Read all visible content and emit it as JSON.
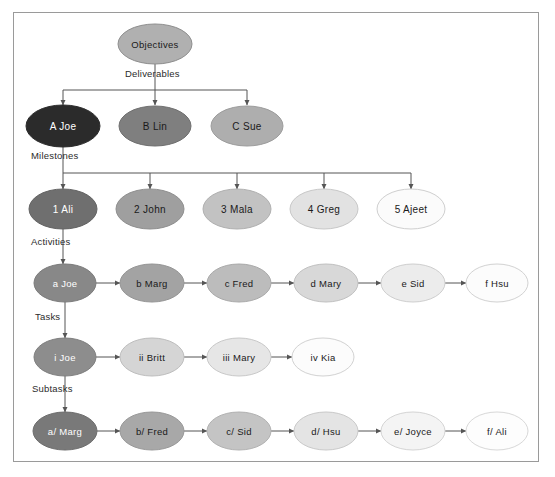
{
  "diagram": {
    "frame": {
      "x": 13,
      "y": 12,
      "width": 526,
      "height": 450,
      "border_color": "#9a9a9a"
    },
    "connector_color": "#555555",
    "levels": [
      {
        "id": "objectives",
        "name": "Objectives"
      },
      {
        "id": "deliverables",
        "name": "Deliverables"
      },
      {
        "id": "milestones",
        "name": "Milestones"
      },
      {
        "id": "activities",
        "name": "Activities"
      },
      {
        "id": "tasks",
        "name": "Tasks"
      },
      {
        "id": "subtasks",
        "name": "Subtasks"
      }
    ],
    "connector_labels": [
      {
        "text": "Deliverables",
        "x": 125,
        "y": 68
      },
      {
        "text": "Milestones",
        "x": 31,
        "y": 150
      },
      {
        "text": "Activities",
        "x": 31,
        "y": 236
      },
      {
        "text": "Tasks",
        "x": 35,
        "y": 311
      },
      {
        "text": "Subtasks",
        "x": 32,
        "y": 383
      }
    ],
    "nodes": [
      {
        "id": "objectives",
        "label": "Objectives",
        "cx": 155,
        "cy": 44,
        "rx": 37,
        "ry": 20,
        "fill": "#b0b0b0",
        "stroke": "#8e8e8e",
        "text_color": "#1a1a1a",
        "font_size": 9.5,
        "row": "objectives"
      },
      {
        "id": "A",
        "label": "A  Joe",
        "cx": 63,
        "cy": 126,
        "rx": 37,
        "ry": 21,
        "fill": "#2b2b2b",
        "stroke": "#2b2b2b",
        "text_color": "#ffffff",
        "font_size": 10,
        "row": "deliverables"
      },
      {
        "id": "B",
        "label": "B  Lin",
        "cx": 155,
        "cy": 126,
        "rx": 36,
        "ry": 20,
        "fill": "#7f7f7f",
        "stroke": "#6f6f6f",
        "text_color": "#1a1a1a",
        "font_size": 10,
        "row": "deliverables"
      },
      {
        "id": "C",
        "label": "C  Sue",
        "cx": 247,
        "cy": 126,
        "rx": 36,
        "ry": 20,
        "fill": "#aeaeae",
        "stroke": "#9c9c9c",
        "text_color": "#1a1a1a",
        "font_size": 10,
        "row": "deliverables"
      },
      {
        "id": "1",
        "label": "1  Ali",
        "cx": 63,
        "cy": 209,
        "rx": 34,
        "ry": 20,
        "fill": "#6f6f6f",
        "stroke": "#636363",
        "text_color": "#ffffff",
        "font_size": 10,
        "row": "milestones"
      },
      {
        "id": "2",
        "label": "2  John",
        "cx": 150,
        "cy": 209,
        "rx": 34,
        "ry": 20,
        "fill": "#9f9f9f",
        "stroke": "#8f8f8f",
        "text_color": "#1a1a1a",
        "font_size": 10,
        "row": "milestones"
      },
      {
        "id": "3",
        "label": "3  Mala",
        "cx": 237,
        "cy": 209,
        "rx": 34,
        "ry": 20,
        "fill": "#c2c2c2",
        "stroke": "#b0b0b0",
        "text_color": "#1a1a1a",
        "font_size": 10,
        "row": "milestones"
      },
      {
        "id": "4",
        "label": "4  Greg",
        "cx": 324,
        "cy": 209,
        "rx": 34,
        "ry": 20,
        "fill": "#e2e2e2",
        "stroke": "#c8c8c8",
        "text_color": "#1a1a1a",
        "font_size": 10,
        "row": "milestones"
      },
      {
        "id": "5",
        "label": "5  Ajeet",
        "cx": 411,
        "cy": 209,
        "rx": 34,
        "ry": 20,
        "fill": "#fbfbfb",
        "stroke": "#cfcfcf",
        "text_color": "#1a1a1a",
        "font_size": 10,
        "row": "milestones"
      },
      {
        "id": "a",
        "label": "a  Joe",
        "cx": 65,
        "cy": 283,
        "rx": 31,
        "ry": 19,
        "fill": "#888888",
        "stroke": "#7a7a7a",
        "text_color": "#ffffff",
        "font_size": 9.5,
        "row": "activities"
      },
      {
        "id": "b",
        "label": "b  Marg",
        "cx": 152,
        "cy": 283,
        "rx": 32,
        "ry": 19,
        "fill": "#a3a3a3",
        "stroke": "#949494",
        "text_color": "#1a1a1a",
        "font_size": 9.5,
        "row": "activities"
      },
      {
        "id": "c",
        "label": "c  Fred",
        "cx": 239,
        "cy": 283,
        "rx": 32,
        "ry": 19,
        "fill": "#bcbcbc",
        "stroke": "#a9a9a9",
        "text_color": "#1a1a1a",
        "font_size": 9.5,
        "row": "activities"
      },
      {
        "id": "d",
        "label": "d  Mary",
        "cx": 326,
        "cy": 283,
        "rx": 32,
        "ry": 19,
        "fill": "#d8d8d8",
        "stroke": "#c0c0c0",
        "text_color": "#1a1a1a",
        "font_size": 9.5,
        "row": "activities"
      },
      {
        "id": "e",
        "label": "e  Sid",
        "cx": 413,
        "cy": 283,
        "rx": 32,
        "ry": 19,
        "fill": "#ececec",
        "stroke": "#cecece",
        "text_color": "#1a1a1a",
        "font_size": 9.5,
        "row": "activities"
      },
      {
        "id": "f",
        "label": "f  Hsu",
        "cx": 497,
        "cy": 283,
        "rx": 31,
        "ry": 19,
        "fill": "#fcfcfc",
        "stroke": "#d2d2d2",
        "text_color": "#1a1a1a",
        "font_size": 9.5,
        "row": "activities"
      },
      {
        "id": "i",
        "label": "i  Joe",
        "cx": 65,
        "cy": 357,
        "rx": 31,
        "ry": 19,
        "fill": "#8d8d8d",
        "stroke": "#7e7e7e",
        "text_color": "#ffffff",
        "font_size": 9.5,
        "row": "tasks"
      },
      {
        "id": "ii",
        "label": "ii  Britt",
        "cx": 152,
        "cy": 357,
        "rx": 32,
        "ry": 19,
        "fill": "#d5d5d5",
        "stroke": "#bdbdbd",
        "text_color": "#1a1a1a",
        "font_size": 9.5,
        "row": "tasks"
      },
      {
        "id": "iii",
        "label": "iii  Mary",
        "cx": 239,
        "cy": 357,
        "rx": 32,
        "ry": 19,
        "fill": "#e6e6e6",
        "stroke": "#c8c8c8",
        "text_color": "#1a1a1a",
        "font_size": 9.5,
        "row": "tasks"
      },
      {
        "id": "iv",
        "label": "iv  Kia",
        "cx": 323,
        "cy": 357,
        "rx": 31,
        "ry": 19,
        "fill": "#fcfcfc",
        "stroke": "#d2d2d2",
        "text_color": "#1a1a1a",
        "font_size": 9.5,
        "row": "tasks"
      },
      {
        "id": "a-slash",
        "label": "a/  Marg",
        "cx": 65,
        "cy": 431,
        "rx": 32,
        "ry": 19,
        "fill": "#797979",
        "stroke": "#6c6c6c",
        "text_color": "#ffffff",
        "font_size": 9.5,
        "row": "subtasks"
      },
      {
        "id": "b-slash",
        "label": "b/  Fred",
        "cx": 152,
        "cy": 431,
        "rx": 32,
        "ry": 19,
        "fill": "#a8a8a8",
        "stroke": "#989898",
        "text_color": "#1a1a1a",
        "font_size": 9.5,
        "row": "subtasks"
      },
      {
        "id": "c-slash",
        "label": "c/  Sid",
        "cx": 239,
        "cy": 431,
        "rx": 32,
        "ry": 19,
        "fill": "#c4c4c4",
        "stroke": "#b1b1b1",
        "text_color": "#1a1a1a",
        "font_size": 9.5,
        "row": "subtasks"
      },
      {
        "id": "d-slash",
        "label": "d/  Hsu",
        "cx": 326,
        "cy": 431,
        "rx": 32,
        "ry": 19,
        "fill": "#e4e4e4",
        "stroke": "#c9c9c9",
        "text_color": "#1a1a1a",
        "font_size": 9.5,
        "row": "subtasks"
      },
      {
        "id": "e-slash",
        "label": "e/  Joyce",
        "cx": 413,
        "cy": 431,
        "rx": 32,
        "ry": 19,
        "fill": "#f4f4f4",
        "stroke": "#d4d4d4",
        "text_color": "#1a1a1a",
        "font_size": 9.5,
        "row": "subtasks"
      },
      {
        "id": "f-slash",
        "label": "f/  Ali",
        "cx": 497,
        "cy": 431,
        "rx": 31,
        "ry": 19,
        "fill": "#fdfdfd",
        "stroke": "#d8d8d8",
        "text_color": "#1a1a1a",
        "font_size": 9.5,
        "row": "subtasks"
      }
    ],
    "edges": {
      "vertical_stems": [
        {
          "from": "objectives",
          "x": 155,
          "y1": 64,
          "y2": 90
        },
        {
          "from": "A",
          "x": 63,
          "y1": 147,
          "y2": 173
        },
        {
          "from": "1",
          "x": 63,
          "y1": 229,
          "y2": 264
        },
        {
          "from": "a",
          "x": 65,
          "y1": 302,
          "y2": 338
        },
        {
          "from": "i",
          "x": 65,
          "y1": 376,
          "y2": 412
        }
      ],
      "buses": [
        {
          "level": "deliverables",
          "y": 90,
          "x1": 63,
          "x2": 247,
          "drops": [
            63,
            155,
            247
          ],
          "drop_to": 105
        },
        {
          "level": "milestones",
          "y": 173,
          "x1": 63,
          "x2": 411,
          "drops": [
            63,
            150,
            237,
            324,
            411
          ],
          "drop_to": 189
        }
      ],
      "chains": [
        {
          "level": "activities",
          "y": 283,
          "pairs": [
            [
              96,
              120
            ],
            [
              184,
              207
            ],
            [
              271,
              294
            ],
            [
              358,
              381
            ],
            [
              445,
              466
            ]
          ]
        },
        {
          "level": "tasks",
          "y": 357,
          "pairs": [
            [
              96,
              120
            ],
            [
              184,
              207
            ],
            [
              271,
              292
            ]
          ]
        },
        {
          "level": "subtasks",
          "y": 431,
          "pairs": [
            [
              97,
              120
            ],
            [
              184,
              207
            ],
            [
              271,
              294
            ],
            [
              358,
              381
            ],
            [
              445,
              466
            ]
          ]
        }
      ]
    }
  }
}
